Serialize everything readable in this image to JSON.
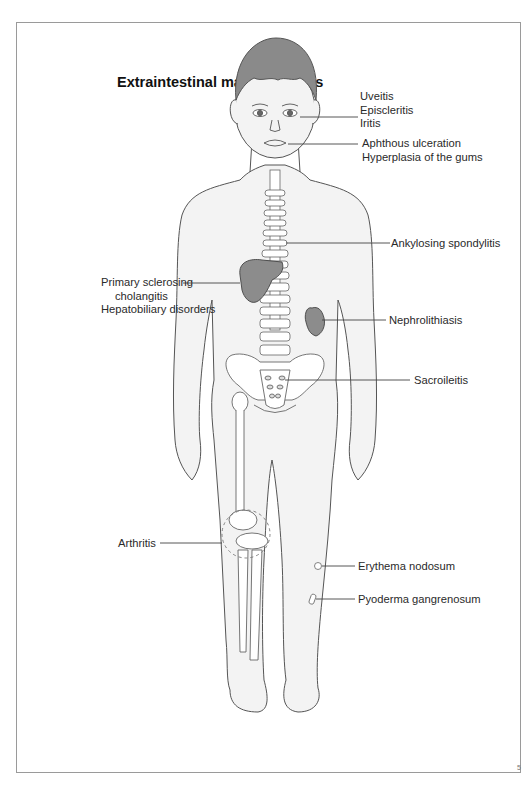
{
  "diagram": {
    "title": "Extraintestinal manifestations",
    "labels": {
      "eye": [
        "Uveitis",
        "Episcleritis",
        "Iritis"
      ],
      "mouth": [
        "Aphthous ulceration",
        "Hyperplasia of the gums"
      ],
      "spine": "Ankylosing spondylitis",
      "liver": [
        "Primary sclerosing",
        "cholangitis",
        "Hepatobiliary disorders"
      ],
      "kidney": "Nephrolithiasis",
      "sacrum": "Sacroileitis",
      "knee": "Arthritis",
      "skin_nodule": "Erythema nodosum",
      "skin_ulcer": "Pyoderma gangrenosum"
    },
    "colors": {
      "outline": "#555555",
      "skin": "#f3f3f3",
      "hair": "#8a8a8a",
      "organ": "#8c8c8c",
      "bone": "#ffffff",
      "leader": "#444444",
      "frame": "#9a9a9a"
    },
    "figure_mark": "5"
  }
}
